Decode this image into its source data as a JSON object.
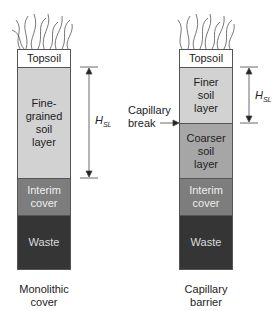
{
  "monolithic": {
    "caption": "Monolithic\ncover",
    "layers": [
      {
        "label": "Topsoil",
        "color": "#ffffff",
        "text_color": "#222222"
      },
      {
        "label": "Fine-\ngrained\nsoil\nlayer",
        "color": "#d2d2d2",
        "text_color": "#222222"
      },
      {
        "label": "Interim\ncover",
        "color": "#7d7d7d",
        "text_color": "#eeeeee"
      },
      {
        "label": "Waste",
        "color": "#353535",
        "text_color": "#dddddd"
      }
    ],
    "dimension_label": "H",
    "dimension_sub": "SL"
  },
  "capillary": {
    "caption": "Capillary\nbarrier",
    "layers": [
      {
        "label": "Topsoil",
        "color": "#ffffff",
        "text_color": "#222222"
      },
      {
        "label": "Finer\nsoil\nlayer",
        "color": "#d2d2d2",
        "text_color": "#222222"
      },
      {
        "label": "Coarser\nsoil\nlayer",
        "color": "#a6a6a6",
        "text_color": "#222222"
      },
      {
        "label": "Interim\ncover",
        "color": "#7d7d7d",
        "text_color": "#eeeeee"
      },
      {
        "label": "Waste",
        "color": "#353535",
        "text_color": "#dddddd"
      }
    ],
    "dimension_label": "H",
    "dimension_sub": "SL",
    "annotation": "Capillary\nbreak"
  }
}
